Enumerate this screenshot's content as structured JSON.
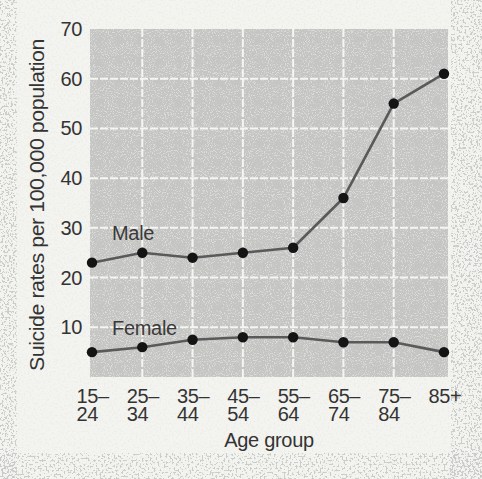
{
  "chart_data": {
    "type": "line",
    "title": "",
    "ylabel": "Suicide rates per 100,000 population",
    "xlabel": "Age group",
    "categories": [
      "15–24",
      "25–34",
      "35–44",
      "45–54",
      "55–64",
      "65–74",
      "75–84",
      "85+"
    ],
    "x_tick_lines": [
      [
        "15–",
        "24"
      ],
      [
        "25–",
        "34"
      ],
      [
        "35–",
        "44"
      ],
      [
        "45–",
        "54"
      ],
      [
        "55–",
        "64"
      ],
      [
        "65–",
        "74"
      ],
      [
        "75–",
        "84"
      ],
      [
        "85+"
      ]
    ],
    "series": [
      {
        "name": "Male",
        "values": [
          23,
          25,
          24,
          25,
          26,
          36,
          55,
          61
        ]
      },
      {
        "name": "Female",
        "values": [
          5,
          6,
          7.5,
          8,
          8,
          7,
          7,
          5
        ]
      }
    ],
    "y_ticks": [
      70,
      60,
      50,
      40,
      30,
      20,
      10
    ],
    "ylim": [
      0,
      70
    ],
    "grid": true,
    "legend": "inline-labels",
    "colors": {
      "page_background": "#f3f3f0",
      "plot_background": "#c5c5c3",
      "gridline": "#f8f8f5",
      "line": "#5a5a5a",
      "marker": "#141414",
      "text": "#333333",
      "speckle": "#8e938c"
    }
  }
}
